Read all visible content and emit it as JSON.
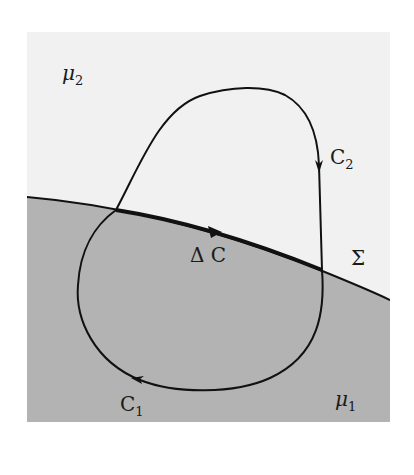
{
  "figure": {
    "colors": {
      "upper_region": "#f1f1f1",
      "lower_region": "#b3b3b3",
      "stroke": "#111111",
      "background": "#ffffff"
    },
    "labels": {
      "mu2": {
        "symbol": "μ",
        "sub": "2"
      },
      "mu1": {
        "symbol": "μ",
        "sub": "1"
      },
      "c2": {
        "symbol": "C",
        "sub": "2"
      },
      "c1": {
        "symbol": "C",
        "sub": "1"
      },
      "delta_c": "Δ C",
      "sigma": "Σ"
    },
    "regions": [
      {
        "name": "upper-medium",
        "label": "μ2"
      },
      {
        "name": "lower-medium",
        "label": "μ1"
      }
    ],
    "curves": [
      {
        "name": "C2",
        "region": "upper",
        "direction": "clockwise"
      },
      {
        "name": "C1",
        "region": "lower",
        "direction": "clockwise"
      },
      {
        "name": "ΔC",
        "along": "interface Σ",
        "direction": "left-to-right"
      }
    ]
  }
}
